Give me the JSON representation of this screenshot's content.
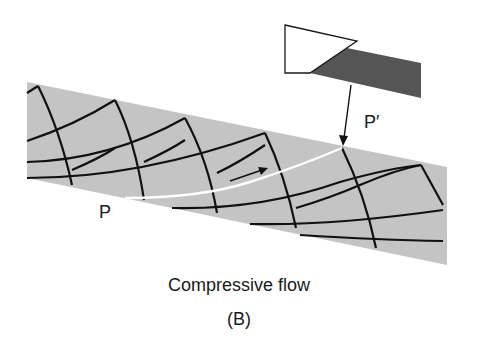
{
  "figure": {
    "caption": "Compressive flow",
    "panel_label": "(B)",
    "point_start_label": "P",
    "point_end_label": "P′"
  },
  "colors": {
    "band_fill": "#c4c4c4",
    "tool_shaded": "#555555",
    "tool_outline": "#1a1a1a",
    "grid_lines": "#111111",
    "flow_line": "#ffffff",
    "text": "#1a1a1a"
  },
  "elements": {
    "band": "gray material band sloping down to the right",
    "tool": "cutting tool: white trapezoid with dark shaded shank",
    "grid": "curved deformation grid lines",
    "flow_path": "white path from P to P′",
    "flow_arrow": "small arrow showing flow direction",
    "pointer_arrow": "arrow from tool to P′"
  }
}
